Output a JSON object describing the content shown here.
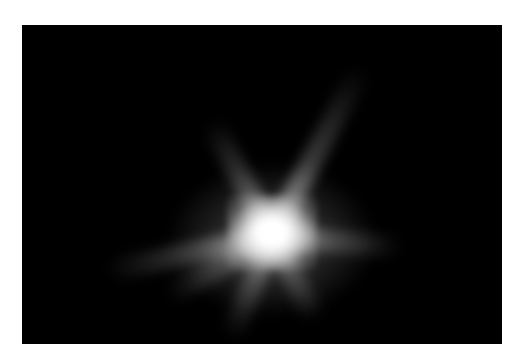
{
  "image": {
    "description": "Bright star-like burst with radiating ejecta streaks on a black background",
    "background_color": "#000000",
    "border_color": "#ffffff",
    "core_color": "#ffffff",
    "rays": [
      {
        "name": "ray-upper-right",
        "angle": -62,
        "length": 190
      },
      {
        "name": "ray-upper-left",
        "angle": -118,
        "length": 130
      },
      {
        "name": "ray-left",
        "angle": 168,
        "length": 170
      },
      {
        "name": "ray-lower-left",
        "angle": 112,
        "length": 110
      },
      {
        "name": "ray-lower-right",
        "angle": 62,
        "length": 95
      },
      {
        "name": "ray-right",
        "angle": 5,
        "length": 130
      },
      {
        "name": "ray-lower-left-2",
        "angle": 150,
        "length": 120
      }
    ]
  }
}
